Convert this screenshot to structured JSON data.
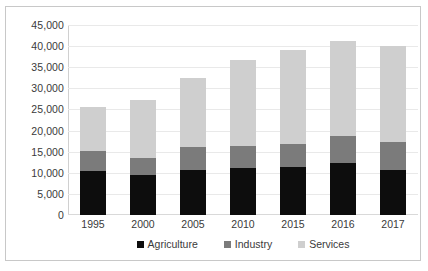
{
  "chart_data": {
    "type": "bar",
    "stacked": true,
    "title": "",
    "xlabel": "",
    "ylabel": "",
    "categories": [
      "1995",
      "2000",
      "2005",
      "2010",
      "2015",
      "2016",
      "2017"
    ],
    "series": [
      {
        "name": "Agriculture",
        "color": "#0d0d0d",
        "values": [
          10400,
          9400,
          10600,
          11100,
          11400,
          12400,
          10600
        ]
      },
      {
        "name": "Industry",
        "color": "#7b7b7b",
        "values": [
          4700,
          4200,
          5500,
          5200,
          5400,
          6200,
          6700
        ]
      },
      {
        "name": "Services",
        "color": "#cfcfcf",
        "values": [
          10600,
          13600,
          16300,
          20300,
          22300,
          22500,
          22800
        ]
      }
    ],
    "totals": [
      25700,
      27200,
      32400,
      36600,
      39100,
      41100,
      40100
    ],
    "ylim": [
      0,
      45000
    ],
    "ytick_step": 5000,
    "yticks": [
      "45,000",
      "40,000",
      "35,000",
      "30,000",
      "25,000",
      "20,000",
      "15,000",
      "10,000",
      "5,000",
      "0"
    ],
    "ytick_values": [
      45000,
      40000,
      35000,
      30000,
      25000,
      20000,
      15000,
      10000,
      5000,
      0
    ],
    "grid": true,
    "legend_position": "bottom",
    "legend": [
      "Agriculture",
      "Industry",
      "Services"
    ]
  }
}
